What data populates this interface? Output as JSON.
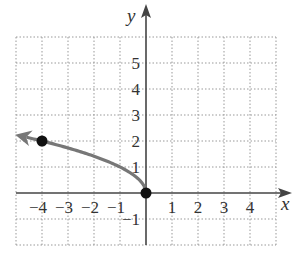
{
  "chart_data": {
    "type": "line",
    "title": "",
    "xlabel": "x",
    "ylabel": "y",
    "xlim": [
      -5,
      5
    ],
    "ylim": [
      -2,
      6
    ],
    "grid": true,
    "grid_style": "dotted",
    "x_ticks": [
      "-4",
      "-3",
      "-2",
      "-1",
      "1",
      "2",
      "3",
      "4"
    ],
    "y_ticks": [
      "5",
      "4",
      "3",
      "2",
      "1",
      "-1"
    ],
    "series": [
      {
        "name": "curve",
        "description": "y = sqrt(-x), arrow continues to the left",
        "x": [
          0,
          -0.25,
          -1,
          -2,
          -3,
          -4,
          -4.6
        ],
        "y": [
          0,
          0.5,
          1,
          1.414,
          1.732,
          2,
          2.14
        ],
        "color": "#777777",
        "arrow_end": "left"
      }
    ],
    "points": [
      {
        "x": -4,
        "y": 2,
        "filled": true
      },
      {
        "x": 0,
        "y": 0,
        "filled": true
      }
    ],
    "colors": {
      "axis": "#444444",
      "grid": "#999999",
      "curve": "#777777",
      "point": "#111111"
    }
  },
  "labels": {
    "x_axis": "x",
    "y_axis": "y",
    "x_ticks": [
      {
        "text": "−4",
        "value": -4
      },
      {
        "text": "−3",
        "value": -3
      },
      {
        "text": "−2",
        "value": -2
      },
      {
        "text": "−1",
        "value": -1
      },
      {
        "text": "1",
        "value": 1
      },
      {
        "text": "2",
        "value": 2
      },
      {
        "text": "3",
        "value": 3
      },
      {
        "text": "4",
        "value": 4
      }
    ],
    "y_ticks": [
      {
        "text": "5",
        "value": 5
      },
      {
        "text": "4",
        "value": 4
      },
      {
        "text": "3",
        "value": 3
      },
      {
        "text": "2",
        "value": 2
      },
      {
        "text": "1",
        "value": 1
      },
      {
        "text": "−1",
        "value": -1
      }
    ]
  }
}
